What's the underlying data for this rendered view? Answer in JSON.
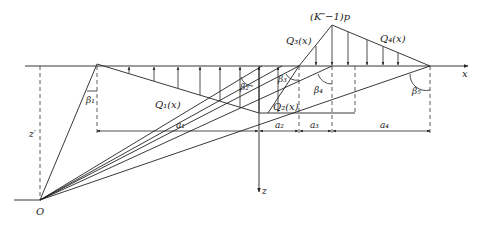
{
  "diagram": {
    "title": "",
    "axis_labels": {
      "x": "x",
      "z": "z",
      "z_prime": "z′",
      "origin": "O"
    },
    "peak_label": "(K″−1)p",
    "load_labels": {
      "Q1": "Q₁(x)",
      "Q2": "Q₂(x)",
      "Q3": "Q₃(x)",
      "Q4": "Q₄(x)"
    },
    "angle_labels": {
      "b1": "β₁",
      "b2": "β₂",
      "b3": "β₃",
      "b4": "β₄",
      "b5": "β₅"
    },
    "dimension_labels": {
      "a1": "a₁",
      "a2": "a₂",
      "a3": "a₃",
      "a4": "a₄"
    },
    "colors": {
      "line": "#222222",
      "background": "#ffffff"
    }
  }
}
